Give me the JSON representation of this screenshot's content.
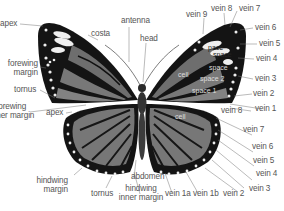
{
  "diagram": {
    "colors": {
      "background": "#ffffff",
      "wing_border": "#151515",
      "wing_cell_fill": "#6e6e6e",
      "wing_cell_light": "#8a8a8a",
      "spot": "#f2f2f2",
      "label_text": "#555555",
      "leader_line": "#777777"
    },
    "labels_left": {
      "apex_top": "apex",
      "costa": "costa",
      "antenna": "antenna",
      "head": "head",
      "forewing_margin": [
        "forewing",
        "margin"
      ],
      "tornus_top": "tornus",
      "forewing_inner_margin": [
        "forewing",
        "inner margin"
      ],
      "apex_hind": "apex",
      "hindwing_margin": [
        "hindwing",
        "margin"
      ],
      "tornus_bottom": "tornus",
      "abdomen": "abdomen",
      "hindwing_inner_margin": [
        "hindwing",
        "inner margin"
      ]
    },
    "labels_right_forewing": {
      "vein9": "vein 9",
      "vein8": "vein 8",
      "vein7": "vein 7",
      "vein6": "vein 6",
      "vein5": "vein 5",
      "vein4": "vein 4",
      "vein3": "vein 3",
      "vein2": "vein 2",
      "vein1": "vein 1"
    },
    "labels_right_hindwing": {
      "vein8": "vein 8",
      "vein7": "vein 7",
      "vein6": "vein 6",
      "vein5": "vein 5",
      "vein4": "vein 4",
      "vein3": "vein 3",
      "vein2": "vein 2",
      "vein1b": "vein 1b",
      "vein1a": "vein 1a"
    },
    "inner_labels": {
      "forewing_cell": "cell",
      "space1": "space 1",
      "space2": "space 2",
      "space3": "space",
      "space_a": "space",
      "space_b": "pace",
      "hindwing_cell": "cell"
    }
  }
}
